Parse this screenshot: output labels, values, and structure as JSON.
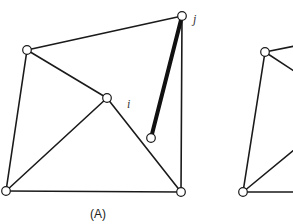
{
  "figure": {
    "panels": [
      {
        "caption": "(A)",
        "caption_pos": [
          98,
          218
        ],
        "nodes": [
          {
            "id": "j",
            "x": 182,
            "y": 16,
            "label": "j",
            "label_pos": [
              193,
              23
            ]
          },
          {
            "id": "tl",
            "x": 27,
            "y": 50
          },
          {
            "id": "i",
            "x": 107,
            "y": 98,
            "label": "i",
            "label_pos": [
              127,
              108
            ]
          },
          {
            "id": "free",
            "x": 151,
            "y": 138
          },
          {
            "id": "bl",
            "x": 6,
            "y": 191
          },
          {
            "id": "br",
            "x": 181,
            "y": 192
          }
        ],
        "edges": [
          {
            "from": "j",
            "to": "tl"
          },
          {
            "from": "j",
            "to": "br"
          },
          {
            "from": "tl",
            "to": "bl"
          },
          {
            "from": "tl",
            "to": "i"
          },
          {
            "from": "i",
            "to": "bl"
          },
          {
            "from": "i",
            "to": "br"
          },
          {
            "from": "bl",
            "to": "br"
          },
          {
            "from": "j",
            "to": "free",
            "bold": true
          }
        ]
      },
      {
        "caption": "",
        "partial": true,
        "nodes": [
          {
            "id": "tl2",
            "x": 265,
            "y": 52
          },
          {
            "id": "bl2",
            "x": 243,
            "y": 192
          }
        ],
        "edges": [
          {
            "from": "tl2",
            "to": "bl2"
          },
          {
            "from": "tl2",
            "to": "offscreen_top",
            "to_xy": [
              300,
              45
            ]
          },
          {
            "from": "tl2",
            "to": "offscreen_diag",
            "to_xy": [
              300,
              75
            ]
          },
          {
            "from": "bl2",
            "to": "offscreen_up",
            "to_xy": [
              300,
              145
            ]
          },
          {
            "from": "bl2",
            "to": "offscreen_right",
            "to_xy": [
              300,
              192
            ]
          }
        ]
      }
    ],
    "colors": {
      "stroke": "#1a1a1a",
      "node_fill": "#ffffff",
      "background": "#ffffff"
    }
  }
}
